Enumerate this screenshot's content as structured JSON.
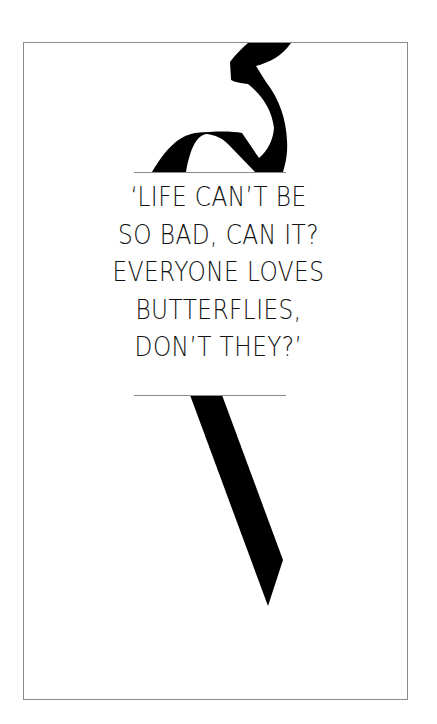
{
  "quote": {
    "lines": [
      "‘LIFE CAN’T BE",
      "SO BAD, CAN IT?",
      "EVERYONE LOVES",
      "BUTTERFLIES,",
      "DON’T THEY?’"
    ]
  },
  "colors": {
    "ribbon": "#000000",
    "frame": "#8a8a8a",
    "background": "#ffffff"
  }
}
